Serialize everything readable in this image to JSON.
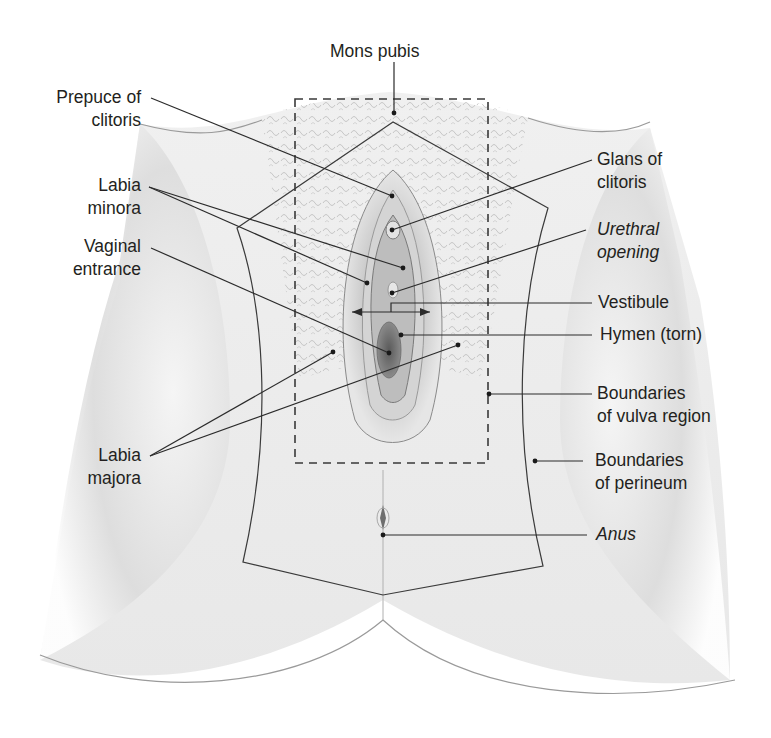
{
  "figure": {
    "colors": {
      "background": "#ffffff",
      "skin_light": "#f2f2f2",
      "skin_mid": "#cfcfcf",
      "skin_dark": "#8f8f8f",
      "line": "#2b2b2b",
      "label_text": "#231f20"
    }
  },
  "labels": {
    "mons_pubis": {
      "line1": "Mons pubis"
    },
    "prepuce_of_clitoris": {
      "line1": "Prepuce of",
      "line2": "clitoris"
    },
    "labia_minora": {
      "line1": "Labia",
      "line2": "minora"
    },
    "vaginal_entrance": {
      "line1": "Vaginal",
      "line2": "entrance"
    },
    "labia_majora": {
      "line1": "Labia",
      "line2": "majora"
    },
    "glans_of_clitoris": {
      "line1": "Glans of",
      "line2": "clitoris"
    },
    "urethral_opening": {
      "line1": "Urethral",
      "line2": "opening",
      "italic": true
    },
    "vestibule": {
      "line1": "Vestibule"
    },
    "hymen": {
      "line1": "Hymen (torn)"
    },
    "boundaries_vulva": {
      "line1": "Boundaries",
      "line2": "of vulva region"
    },
    "boundaries_perineum": {
      "line1": "Boundaries",
      "line2": "of perineum"
    },
    "anus": {
      "line1": "Anus",
      "italic": true
    }
  }
}
